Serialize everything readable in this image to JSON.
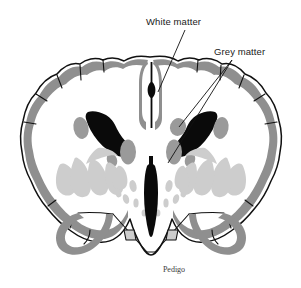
{
  "figure": {
    "type": "anatomical-diagram",
    "background_color": "#ffffff",
    "credit": "Pedigo"
  },
  "labels": [
    {
      "id": "white-matter",
      "text": "White matter",
      "x": 146,
      "y": 25,
      "leader": {
        "from_x": 185,
        "from_y": 30,
        "to_x": 158,
        "to_y": 92
      }
    },
    {
      "id": "grey-matter",
      "text": "Grey matter",
      "x": 214,
      "y": 55,
      "leaders": [
        {
          "from_x": 232,
          "from_y": 60,
          "to_x": 179,
          "to_y": 127
        },
        {
          "from_x": 232,
          "from_y": 60,
          "to_x": 168,
          "to_y": 163
        }
      ]
    }
  ],
  "colors": {
    "outline": "#111111",
    "grey_matter_cortex": "#8f8f8f",
    "grey_matter_nuclei": "#9a9a9a",
    "light_grey_structures": "#cdcdcd",
    "ventricles_black": "#0a0a0a",
    "white_matter": "#ffffff",
    "label_text": "#1a1a1a",
    "credit_text": "#3a3a3a"
  },
  "structures": [
    {
      "name": "cerebral-cortex-ribbon",
      "tone": "grey_matter_cortex"
    },
    {
      "name": "lateral-ventricles",
      "tone": "ventricles_black"
    },
    {
      "name": "third-ventricle",
      "tone": "ventricles_black"
    },
    {
      "name": "interhemispheric-fissure",
      "tone": "ventricles_black"
    },
    {
      "name": "caudate-nucleus",
      "tone": "grey_matter_nuclei"
    },
    {
      "name": "thalamus",
      "tone": "grey_matter_nuclei"
    },
    {
      "name": "lentiform-nucleus-striations",
      "tone": "light_grey_structures"
    },
    {
      "name": "corpus-callosum-white-matter",
      "tone": "white_matter"
    },
    {
      "name": "temporal-lobe-left",
      "tone": "grey_matter_cortex"
    },
    {
      "name": "temporal-lobe-right",
      "tone": "grey_matter_cortex"
    },
    {
      "name": "hippocampus-left",
      "tone": "grey_matter_cortex"
    },
    {
      "name": "hippocampus-right",
      "tone": "grey_matter_cortex"
    }
  ]
}
